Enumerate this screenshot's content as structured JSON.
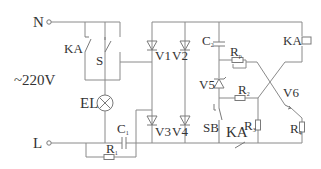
{
  "diagram": {
    "title": "",
    "terminals": {
      "neutral": "N",
      "line": "L"
    },
    "supply": "~220V",
    "labels": {
      "ka_contact": "KA",
      "switch": "S",
      "lamp": "EL",
      "c1": "C",
      "c1_sub": "1",
      "r1": "R",
      "r1_sub": "1",
      "v1": "V1",
      "v2": "V2",
      "v3": "V3",
      "v4": "V4",
      "c2": "C",
      "c2_sub": "2",
      "rp": "R",
      "rp_sub": "p",
      "v5": "V5",
      "r2": "R",
      "r2_sub": "2",
      "sb": "SB",
      "ka_bottom": "KA",
      "r3": "R",
      "r3_sub": "3",
      "v6": "V6",
      "r4": "R",
      "r4_sub": "4",
      "ka_coil": "KA"
    },
    "components": [
      {
        "id": "KA",
        "type": "relay-contact"
      },
      {
        "id": "S",
        "type": "switch"
      },
      {
        "id": "EL",
        "type": "lamp"
      },
      {
        "id": "C1",
        "type": "capacitor"
      },
      {
        "id": "R1",
        "type": "resistor"
      },
      {
        "id": "V1",
        "type": "diode"
      },
      {
        "id": "V2",
        "type": "diode"
      },
      {
        "id": "V3",
        "type": "diode"
      },
      {
        "id": "V4",
        "type": "diode"
      },
      {
        "id": "C2",
        "type": "capacitor"
      },
      {
        "id": "Rp",
        "type": "potentiometer"
      },
      {
        "id": "V5",
        "type": "zener-diode"
      },
      {
        "id": "R2",
        "type": "resistor"
      },
      {
        "id": "SB",
        "type": "push-button"
      },
      {
        "id": "R3",
        "type": "resistor"
      },
      {
        "id": "V6",
        "type": "transistor"
      },
      {
        "id": "R4",
        "type": "resistor"
      },
      {
        "id": "KA-coil",
        "type": "relay-coil"
      }
    ]
  }
}
